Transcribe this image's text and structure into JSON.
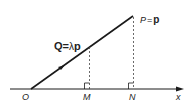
{
  "diagram": {
    "title": "",
    "labels": {
      "origin": "O",
      "m": "M",
      "n": "N",
      "x_axis": "x",
      "p_point": "P",
      "p_eq": "=",
      "p_vec": "p",
      "q_point": "Q",
      "q_eq": "=",
      "q_lambda": "λ",
      "q_vec": "p"
    },
    "colors": {
      "line": "#1a1a1a",
      "text": "#222222",
      "background": "#ffffff"
    }
  }
}
